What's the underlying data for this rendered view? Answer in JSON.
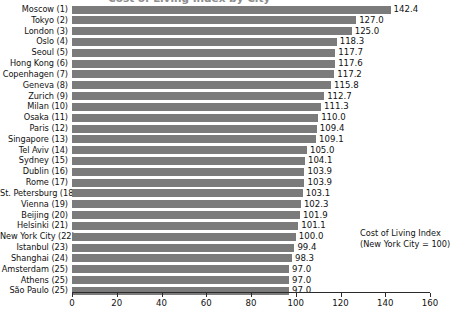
{
  "chart_data": {
    "type": "bar",
    "orientation": "horizontal",
    "title": "Cost of Living Index by City",
    "xlabel": "",
    "ylabel": "",
    "xlim": [
      0,
      160
    ],
    "xticks": [
      0,
      20,
      40,
      60,
      80,
      100,
      120,
      140,
      160
    ],
    "grid": false,
    "legend": null,
    "bar_color": "#7b7b7b",
    "annotation": {
      "line1": "Cost of Living Index",
      "line2": "(New York City = 100)"
    },
    "categories": [
      "Moscow (1)",
      "Tokyo (2)",
      "London (3)",
      "Oslo (4)",
      "Seoul (5)",
      "Hong Kong (6)",
      "Copenhagen (7)",
      "Geneva (8)",
      "Zurich (9)",
      "Milan (10)",
      "Osaka (11)",
      "Paris (12)",
      "Singapore (13)",
      "Tel Aviv (14)",
      "Sydney (15)",
      "Dublin (16)",
      "Rome (17)",
      "St. Petersburg (18)",
      "Vienna (19)",
      "Beijing (20)",
      "Helsinki (21)",
      "New York City (22)",
      "Istanbul (23)",
      "Shanghai (24)",
      "Amsterdam (25)",
      "Athens (25)",
      "São Paulo (25)"
    ],
    "values": [
      142.4,
      127.0,
      125.0,
      118.3,
      117.7,
      117.6,
      117.2,
      115.8,
      112.7,
      111.3,
      110.0,
      109.4,
      109.1,
      105.0,
      104.1,
      103.9,
      103.9,
      103.1,
      102.3,
      101.9,
      101.1,
      100.0,
      99.4,
      98.3,
      97.0,
      97.0,
      97.0
    ],
    "value_labels": [
      "142.4",
      "127.0",
      "125.0",
      "118.3",
      "117.7",
      "117.6",
      "117.2",
      "115.8",
      "112.7",
      "111.3",
      "110.0",
      "109.4",
      "109.1",
      "105.0",
      "104.1",
      "103.9",
      "103.9",
      "103.1",
      "102.3",
      "101.9",
      "101.1",
      "100.0",
      "99.4",
      "98.3",
      "97.0",
      "97.0",
      "97.0"
    ]
  }
}
